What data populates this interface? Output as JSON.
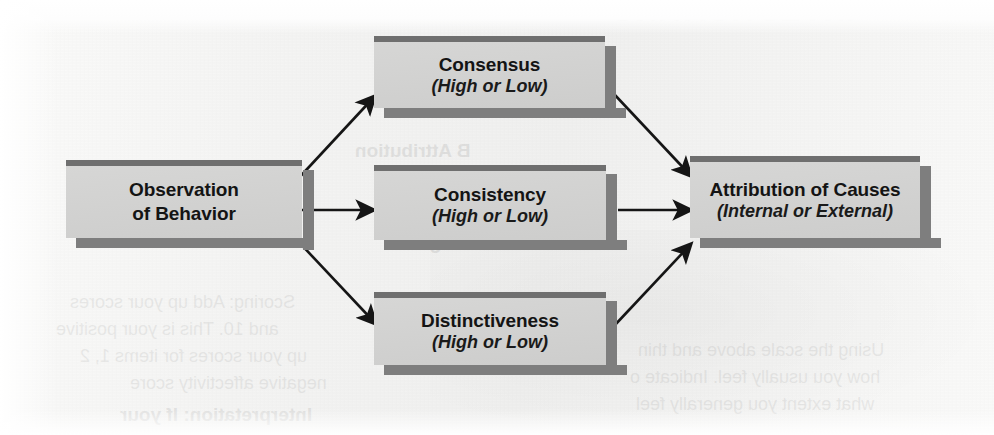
{
  "diagram": {
    "colors": {
      "box_fill": "#d3d3d2",
      "box_bar": "#6f6f6f",
      "box_shadow": "#7e7e7e",
      "arrow": "#151515",
      "page": "#f4f4f3"
    },
    "nodes": [
      {
        "id": "observation",
        "title": "Observation",
        "title2": "of Behavior",
        "subtitle": ""
      },
      {
        "id": "consensus",
        "title": "Consensus",
        "title2": "",
        "subtitle": "(High or Low)"
      },
      {
        "id": "consistency",
        "title": "Consistency",
        "title2": "",
        "subtitle": "(High or Low)"
      },
      {
        "id": "distinctiveness",
        "title": "Distinctiveness",
        "title2": "",
        "subtitle": "(High or Low)"
      },
      {
        "id": "attribution",
        "title": "Attribution of Causes",
        "title2": "",
        "subtitle": "(Internal or External)"
      }
    ],
    "edges": [
      {
        "id": "observation-to-consensus",
        "from": "observation",
        "to": "consensus"
      },
      {
        "id": "observation-to-consistency",
        "from": "observation",
        "to": "consistency"
      },
      {
        "id": "observation-to-distinctiveness",
        "from": "observation",
        "to": "distinctiveness"
      },
      {
        "id": "consensus-to-attribution",
        "from": "consensus",
        "to": "attribution"
      },
      {
        "id": "consistency-to-attribution",
        "from": "consistency",
        "to": "attribution"
      },
      {
        "id": "distinctiveness-to-attribution",
        "from": "distinctiveness",
        "to": "attribution"
      }
    ]
  },
  "bleedthrough": {
    "note": "Faint mirrored text showing through from the reverse side of the scanned page",
    "lines": [
      "INVESTIGATING",
      "B  Attribution",
      "3",
      "Scoring: Add up your scores",
      "and 10. This is your positive",
      "up your scores for items 1, 2",
      "negative affectivity score",
      "Interpretation: If your",
      "Using the scale above and thin",
      "how you usually feel. Indicate o",
      "what extent you generally feel"
    ]
  }
}
